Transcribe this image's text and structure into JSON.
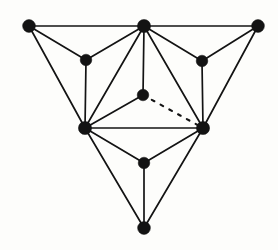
{
  "figure": {
    "title": "Planar graph diagram",
    "background_color": "#fdfdfb",
    "stroke_color": "#131313",
    "width": 278,
    "height": 250
  },
  "chart_data": {
    "type": "diagram",
    "subtype": "node-link graph",
    "title": "Planar graph diagram",
    "vertex_count": 10,
    "edge_count": 21,
    "vertex_radius": 6.2,
    "inner_vertex_radius": 5.4,
    "vertices": [
      {
        "id": "v1",
        "label": "top-left",
        "x": 29,
        "y": 26,
        "r": 6.4
      },
      {
        "id": "v2",
        "label": "top-center",
        "x": 144,
        "y": 26,
        "r": 6.6
      },
      {
        "id": "v3",
        "label": "top-right",
        "x": 258,
        "y": 26,
        "r": 6.4
      },
      {
        "id": "v4",
        "label": "upper-left-inner",
        "x": 86,
        "y": 60,
        "r": 5.8
      },
      {
        "id": "v5",
        "label": "upper-right-inner",
        "x": 202,
        "y": 61,
        "r": 5.8
      },
      {
        "id": "v6",
        "label": "center",
        "x": 143,
        "y": 95,
        "r": 5.8
      },
      {
        "id": "v7",
        "label": "mid-left",
        "x": 85,
        "y": 128,
        "r": 6.6
      },
      {
        "id": "v8",
        "label": "mid-right",
        "x": 203,
        "y": 128,
        "r": 6.6
      },
      {
        "id": "v9",
        "label": "lower-center",
        "x": 144,
        "y": 163,
        "r": 5.8
      },
      {
        "id": "v10",
        "label": "bottom",
        "x": 144,
        "y": 228,
        "r": 6.4
      }
    ],
    "edges": [
      {
        "from": "v1",
        "to": "v2",
        "style": "solid"
      },
      {
        "from": "v2",
        "to": "v3",
        "style": "solid"
      },
      {
        "from": "v1",
        "to": "v4",
        "style": "solid"
      },
      {
        "from": "v2",
        "to": "v4",
        "style": "solid"
      },
      {
        "from": "v2",
        "to": "v5",
        "style": "solid"
      },
      {
        "from": "v3",
        "to": "v5",
        "style": "solid"
      },
      {
        "from": "v1",
        "to": "v7",
        "style": "solid"
      },
      {
        "from": "v4",
        "to": "v7",
        "style": "solid"
      },
      {
        "from": "v2",
        "to": "v7",
        "style": "solid"
      },
      {
        "from": "v2",
        "to": "v6",
        "style": "solid"
      },
      {
        "from": "v2",
        "to": "v8",
        "style": "solid"
      },
      {
        "from": "v5",
        "to": "v8",
        "style": "solid"
      },
      {
        "from": "v3",
        "to": "v8",
        "style": "solid"
      },
      {
        "from": "v6",
        "to": "v7",
        "style": "solid"
      },
      {
        "from": "v6",
        "to": "v8",
        "style": "dashed"
      },
      {
        "from": "v7",
        "to": "v8",
        "style": "solid"
      },
      {
        "from": "v7",
        "to": "v9",
        "style": "solid"
      },
      {
        "from": "v8",
        "to": "v9",
        "style": "solid"
      },
      {
        "from": "v9",
        "to": "v10",
        "style": "solid"
      },
      {
        "from": "v7",
        "to": "v10",
        "style": "solid"
      },
      {
        "from": "v8",
        "to": "v10",
        "style": "solid"
      }
    ],
    "legend": [],
    "annotations": []
  }
}
